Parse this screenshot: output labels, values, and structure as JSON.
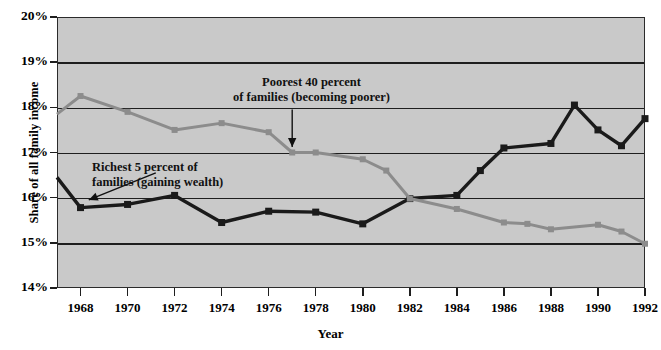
{
  "chart_data": {
    "type": "line",
    "title": "",
    "xlabel": "Year",
    "ylabel": "Share of all family income",
    "xlim": [
      1967,
      1992
    ],
    "ylim": [
      14,
      20
    ],
    "ytick_values": [
      14,
      15,
      16,
      17,
      18,
      19,
      20
    ],
    "ytick_labels": [
      "14%",
      "15%",
      "16%",
      "17%",
      "18%",
      "19%",
      "20%"
    ],
    "xtick_values": [
      1968,
      1970,
      1972,
      1974,
      1976,
      1978,
      1980,
      1982,
      1984,
      1986,
      1988,
      1990,
      1992
    ],
    "xtick_labels": [
      "1968",
      "1970",
      "1972",
      "1974",
      "1976",
      "1978",
      "1980",
      "1982",
      "1984",
      "1986",
      "1988",
      "1990",
      "1992"
    ],
    "grid": "horizontal",
    "legend_position": "inline-annotations",
    "plot_background": "#c9c9c9",
    "series": [
      {
        "name": "Richest 5 percent of families (gaining wealth)",
        "color": "#1a1a1a",
        "marker": "square",
        "x": [
          1967,
          1968,
          1970,
          1972,
          1974,
          1976,
          1978,
          1980,
          1982,
          1984,
          1985,
          1986,
          1988,
          1989,
          1990,
          1991,
          1992
        ],
        "values": [
          16.45,
          15.78,
          15.85,
          16.05,
          15.45,
          15.7,
          15.68,
          15.42,
          15.98,
          16.05,
          16.6,
          17.1,
          17.2,
          18.05,
          17.5,
          17.15,
          17.75
        ]
      },
      {
        "name": "Poorest 40 percent of families (becoming poorer)",
        "color": "#8c8c8c",
        "marker": "square",
        "x": [
          1967,
          1968,
          1970,
          1972,
          1974,
          1976,
          1977,
          1978,
          1980,
          1981,
          1982,
          1984,
          1986,
          1987,
          1988,
          1990,
          1991,
          1992
        ],
        "values": [
          17.85,
          18.25,
          17.9,
          17.5,
          17.65,
          17.45,
          17.0,
          17.0,
          16.85,
          16.6,
          15.98,
          15.75,
          15.45,
          15.42,
          15.3,
          15.4,
          15.25,
          14.98
        ]
      }
    ],
    "annotations": [
      {
        "id": "poorest",
        "line1": "Poorest 40 percent",
        "line2": "of families (becoming poorer)",
        "arrow": {
          "from_x": 1977.0,
          "from_y": 17.95,
          "to_x": 1977.0,
          "to_y": 17.12
        }
      },
      {
        "id": "richest",
        "line1": "Richest 5 percent of",
        "line2": "families (gaining wealth)",
        "arrow": {
          "from_x": 1971.2,
          "from_y": 16.55,
          "to_x": 1968.35,
          "to_y": 15.95
        }
      }
    ]
  }
}
